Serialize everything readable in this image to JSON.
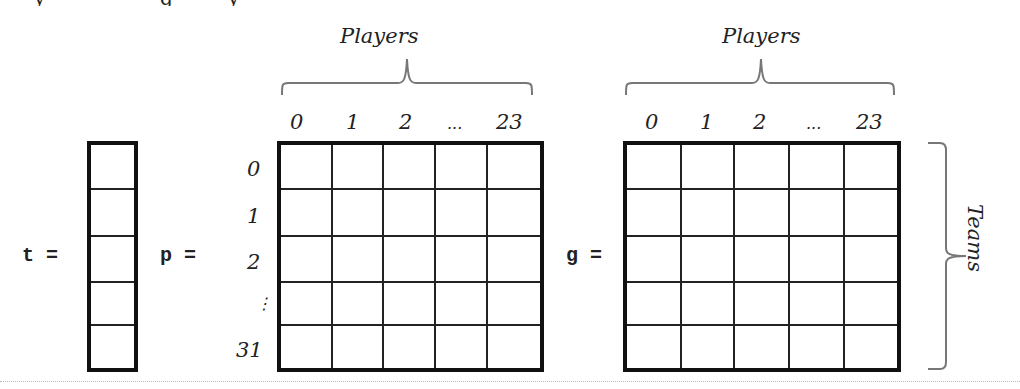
{
  "top_clipped_text": {
    "fragments": [
      "y",
      "g",
      "y"
    ]
  },
  "diagram": {
    "t": {
      "label": "t =",
      "rows": 5
    },
    "p": {
      "label": "p =",
      "brace_label": "Players",
      "col_labels": [
        "0",
        "1",
        "2",
        "...",
        "23"
      ],
      "row_labels": [
        "0",
        "1",
        "2",
        "⋮",
        "31"
      ],
      "rows": 5,
      "cols": 5
    },
    "g": {
      "label": "g =",
      "brace_label": "Players",
      "col_labels": [
        "0",
        "1",
        "2",
        "...",
        "23"
      ],
      "side_brace_label": "Teams",
      "rows": 5,
      "cols": 5
    },
    "colors": {
      "line": "#111111",
      "brace": "#777777",
      "text": "#222222",
      "background": "#ffffff"
    }
  }
}
